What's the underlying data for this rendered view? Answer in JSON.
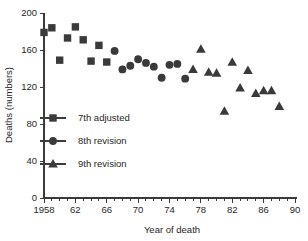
{
  "chart_data": {
    "type": "scatter",
    "title": "",
    "xlabel": "Year of death",
    "ylabel": "Deaths (numbers)",
    "xlim": [
      1958,
      1990
    ],
    "ylim": [
      0,
      200
    ],
    "grid": false,
    "legend_position": "inside-lower-left",
    "x_tick_labels": [
      "1958",
      "62",
      "66",
      "70",
      "74",
      "78",
      "82",
      "86",
      "90"
    ],
    "x_tick_values": [
      1958,
      1962,
      1966,
      1970,
      1974,
      1978,
      1982,
      1986,
      1990
    ],
    "x_minor_step": 1,
    "y_tick_labels": [
      "0",
      "40",
      "80",
      "120",
      "160",
      "200"
    ],
    "y_tick_values": [
      0,
      40,
      80,
      120,
      160,
      200
    ],
    "series": [
      {
        "name": "7th adjusted",
        "marker": "square",
        "color": "#3a3a3a",
        "points": [
          {
            "x": 1958,
            "y": 179
          },
          {
            "x": 1959,
            "y": 184
          },
          {
            "x": 1960,
            "y": 149
          },
          {
            "x": 1961,
            "y": 173
          },
          {
            "x": 1962,
            "y": 185
          },
          {
            "x": 1963,
            "y": 171
          },
          {
            "x": 1964,
            "y": 148
          },
          {
            "x": 1965,
            "y": 165
          },
          {
            "x": 1966,
            "y": 147
          }
        ]
      },
      {
        "name": "8th revision",
        "marker": "circle",
        "color": "#3a3a3a",
        "points": [
          {
            "x": 1967,
            "y": 159
          },
          {
            "x": 1968,
            "y": 139
          },
          {
            "x": 1969,
            "y": 143
          },
          {
            "x": 1970,
            "y": 150
          },
          {
            "x": 1971,
            "y": 146
          },
          {
            "x": 1972,
            "y": 142
          },
          {
            "x": 1973,
            "y": 130
          },
          {
            "x": 1974,
            "y": 144
          },
          {
            "x": 1975,
            "y": 145
          },
          {
            "x": 1976,
            "y": 129
          }
        ]
      },
      {
        "name": "9th revision",
        "marker": "triangle",
        "color": "#3a3a3a",
        "points": [
          {
            "x": 1977,
            "y": 139
          },
          {
            "x": 1978,
            "y": 161
          },
          {
            "x": 1979,
            "y": 136
          },
          {
            "x": 1980,
            "y": 135
          },
          {
            "x": 1981,
            "y": 94
          },
          {
            "x": 1982,
            "y": 147
          },
          {
            "x": 1983,
            "y": 119
          },
          {
            "x": 1984,
            "y": 138
          },
          {
            "x": 1985,
            "y": 113
          },
          {
            "x": 1986,
            "y": 116
          },
          {
            "x": 1987,
            "y": 116
          },
          {
            "x": 1988,
            "y": 99
          }
        ]
      }
    ],
    "legend_entries": [
      {
        "label": "7th adjusted",
        "marker": "square"
      },
      {
        "label": "8th revision",
        "marker": "circle"
      },
      {
        "label": "9th revision",
        "marker": "triangle"
      }
    ]
  }
}
